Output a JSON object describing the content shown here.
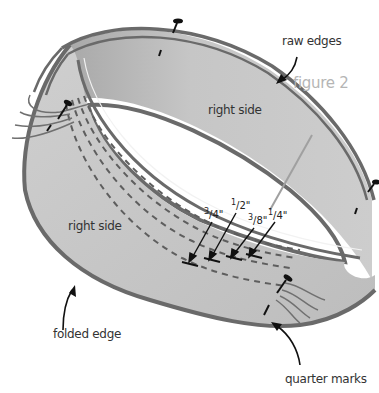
{
  "figure": {
    "caption": "figure 2"
  },
  "labels": {
    "raw_edges": "raw edges",
    "right_side_inner": "right side",
    "right_side_outer": "right side",
    "folded_edge": "folded edge",
    "quarter_marks": "quarter marks"
  },
  "seam_allowances": [
    {
      "label": "3/4\"",
      "num": "3",
      "den": "4\""
    },
    {
      "label": "1/2\"",
      "num": "1",
      "den": "2\""
    },
    {
      "label": "3/8\"",
      "num": "3",
      "den": "8\""
    },
    {
      "label": "1/4\"",
      "num": "1",
      "den": "4\""
    }
  ],
  "colors": {
    "band_fill": "#c9c9c9",
    "band_fill_dark": "#b4b4b4",
    "outline": "#6a6a6a",
    "stitch": "#5e5e5e",
    "pin": "#111111",
    "caption": "#b5b5b5",
    "text": "#333333"
  }
}
